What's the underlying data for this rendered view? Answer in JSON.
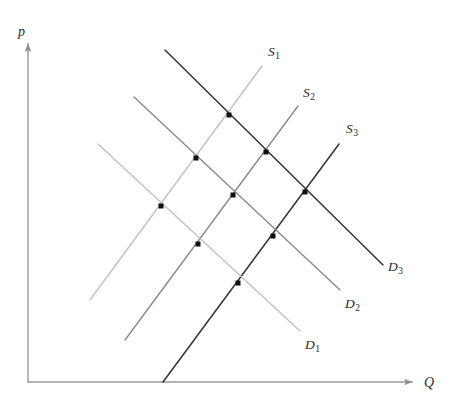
{
  "figure": {
    "kind": "supply-demand-shift-diagram",
    "width": 456,
    "height": 412,
    "background": "#ffffff"
  },
  "axes": {
    "origin": [
      28,
      382
    ],
    "vertical": {
      "label": "p",
      "label_pos": [
        18,
        24
      ],
      "from": [
        28,
        382
      ],
      "to": [
        28,
        44
      ],
      "arrow": true
    },
    "horizontal": {
      "label": "Q",
      "label_pos": [
        424,
        375
      ],
      "from": [
        28,
        382
      ],
      "to": [
        412,
        382
      ],
      "arrow": true
    },
    "color": "#9a9a9a",
    "stroke_width": 1.4
  },
  "colors": {
    "curve_light": "#c2c2c2",
    "curve_medium": "#8a8a8a",
    "curve_dark": "#333333",
    "axis": "#9a9a9a",
    "point": "#111111",
    "text": "#2a2a2a"
  },
  "chart_data": {
    "type": "line",
    "title": "",
    "xlabel": "Q",
    "ylabel": "p",
    "grid": false,
    "legend": "inline-curve-labels",
    "series": [
      {
        "name": "S1",
        "kind": "supply",
        "shade": "light",
        "color": "#c2c2c2",
        "from": [
          90,
          300
        ],
        "to": [
          262,
          66
        ],
        "label": "S",
        "sub": "1",
        "label_pos": [
          268,
          44
        ]
      },
      {
        "name": "S2",
        "kind": "supply",
        "shade": "medium",
        "color": "#8a8a8a",
        "from": [
          125,
          340
        ],
        "to": [
          298,
          106
        ],
        "label": "S",
        "sub": "2",
        "label_pos": [
          303,
          85
        ]
      },
      {
        "name": "S3",
        "kind": "supply",
        "shade": "dark",
        "color": "#333333",
        "from": [
          163,
          382
        ],
        "to": [
          339,
          144
        ],
        "label": "S",
        "sub": "3",
        "label_pos": [
          346,
          121
        ]
      },
      {
        "name": "D1",
        "kind": "demand",
        "shade": "light",
        "color": "#c2c2c2",
        "from": [
          98,
          144
        ],
        "to": [
          300,
          331
        ],
        "label": "D",
        "sub": "1",
        "label_pos": [
          305,
          337
        ]
      },
      {
        "name": "D2",
        "kind": "demand",
        "shade": "medium",
        "color": "#8a8a8a",
        "from": [
          134,
          97
        ],
        "to": [
          340,
          290
        ],
        "label": "D",
        "sub": "2",
        "label_pos": [
          345,
          296
        ]
      },
      {
        "name": "D3",
        "kind": "demand",
        "shade": "dark",
        "color": "#333333",
        "from": [
          165,
          50
        ],
        "to": [
          383,
          265
        ],
        "label": "D",
        "sub": "3",
        "label_pos": [
          388,
          259
        ]
      }
    ],
    "equilibria": [
      {
        "name": "S1D3",
        "supply": "S1",
        "demand": "D3",
        "x": 229,
        "y": 115
      },
      {
        "name": "S1D2",
        "supply": "S1",
        "demand": "D2",
        "x": 196,
        "y": 158
      },
      {
        "name": "S1D1",
        "supply": "S1",
        "demand": "D1",
        "x": 161,
        "y": 206
      },
      {
        "name": "S2D3",
        "supply": "S2",
        "demand": "D3",
        "x": 266,
        "y": 152
      },
      {
        "name": "S2D2",
        "supply": "S2",
        "demand": "D2",
        "x": 233,
        "y": 195
      },
      {
        "name": "S2D1",
        "supply": "S2",
        "demand": "D1",
        "x": 198,
        "y": 244
      },
      {
        "name": "S3D3",
        "supply": "S3",
        "demand": "D3",
        "x": 305,
        "y": 192
      },
      {
        "name": "S3D2",
        "supply": "S3",
        "demand": "D2",
        "x": 273,
        "y": 236
      },
      {
        "name": "S3D1",
        "supply": "S3",
        "demand": "D1",
        "x": 238,
        "y": 283
      }
    ],
    "point_marker": {
      "shape": "square",
      "size": 5,
      "color": "#111111"
    }
  }
}
